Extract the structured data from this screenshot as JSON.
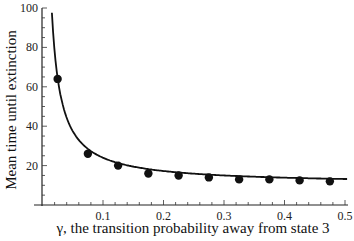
{
  "chart_data": {
    "type": "line",
    "title": "",
    "xlabel": "γ, the transition probability away from state 3",
    "ylabel": "Mean time until extinction",
    "xlim": [
      0,
      0.5
    ],
    "ylim": [
      0,
      100
    ],
    "x_ticks": [
      0.1,
      0.2,
      0.3,
      0.4,
      0.5
    ],
    "x_tick_labels": [
      "0.1",
      "0.2",
      "0.3",
      "0.4",
      "0.5"
    ],
    "y_ticks": [
      20,
      40,
      60,
      80,
      100
    ],
    "y_tick_labels": [
      "20",
      "40",
      "60",
      "80",
      "100"
    ],
    "grid": false,
    "legend": null,
    "series": [
      {
        "name": "curve",
        "style": "line",
        "x": [
          0.02,
          0.025,
          0.03,
          0.04,
          0.05,
          0.06,
          0.075,
          0.1,
          0.125,
          0.15,
          0.175,
          0.2,
          0.225,
          0.25,
          0.275,
          0.3,
          0.325,
          0.35,
          0.375,
          0.4,
          0.425,
          0.45,
          0.475,
          0.5
        ],
        "y": [
          100,
          64,
          52,
          40,
          33,
          29,
          26,
          22.5,
          20,
          17.5,
          16,
          15.5,
          15,
          14.5,
          14,
          13.5,
          13,
          13,
          13,
          12.8,
          12.5,
          12.3,
          12,
          12
        ]
      },
      {
        "name": "points",
        "style": "scatter",
        "x": [
          0.025,
          0.075,
          0.125,
          0.175,
          0.225,
          0.275,
          0.325,
          0.375,
          0.425,
          0.475
        ],
        "y": [
          64,
          26,
          20,
          16,
          15,
          14,
          13,
          13,
          12.5,
          12
        ]
      }
    ]
  }
}
